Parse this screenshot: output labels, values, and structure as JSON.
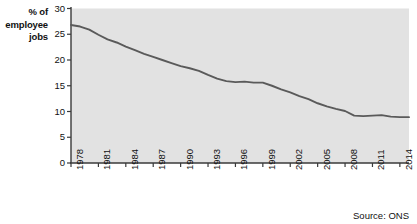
{
  "chart_data": {
    "type": "line",
    "title": "",
    "subtitle": "",
    "ylabel": "% of employee jobs",
    "xlabel": "",
    "ylim": [
      0,
      30
    ],
    "xlim": [
      1978,
      2015
    ],
    "yticks": [
      0,
      5,
      10,
      15,
      20,
      25,
      30
    ],
    "xticks": [
      1978,
      1981,
      1984,
      1987,
      1990,
      1993,
      1996,
      1999,
      2002,
      2005,
      2008,
      2011,
      2014
    ],
    "grid": false,
    "legend": "none",
    "series": [
      {
        "name": "% of employee jobs",
        "color": "#5a5a5a",
        "x": [
          1978,
          1979,
          1980,
          1981,
          1982,
          1983,
          1984,
          1985,
          1986,
          1987,
          1988,
          1989,
          1990,
          1991,
          1992,
          1993,
          1994,
          1995,
          1996,
          1997,
          1998,
          1999,
          2000,
          2001,
          2002,
          2003,
          2004,
          2005,
          2006,
          2007,
          2008,
          2009,
          2010,
          2011,
          2012,
          2013,
          2014,
          2015
        ],
        "values": [
          26.8,
          26.5,
          25.9,
          24.9,
          24.0,
          23.4,
          22.6,
          21.9,
          21.2,
          20.6,
          20.0,
          19.4,
          18.8,
          18.4,
          17.9,
          17.1,
          16.4,
          15.9,
          15.7,
          15.8,
          15.6,
          15.6,
          15.0,
          14.3,
          13.7,
          13.0,
          12.4,
          11.6,
          11.0,
          10.5,
          10.1,
          9.2,
          9.1,
          9.2,
          9.3,
          9.0,
          8.9,
          8.9
        ]
      }
    ],
    "source": "Source: ONS",
    "plot_background": "#e2e2e2",
    "line_color": "#5a5a5a",
    "axis_color": "#3a3a3a"
  },
  "labels": {
    "axis_title_line1": "% of",
    "axis_title_line2": "employee",
    "axis_title_line3": "jobs",
    "axis_title_full": "% of\nemployee\njobs",
    "source": "Source: ONS"
  }
}
